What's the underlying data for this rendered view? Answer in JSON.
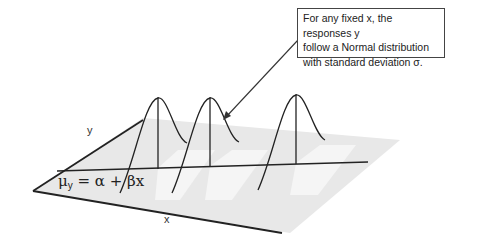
{
  "callout": {
    "lines": [
      "For any fixed x, the responses y",
      "follow a Normal distribution",
      "with standard deviation σ."
    ]
  },
  "axes": {
    "x_label": "x",
    "y_label": "y"
  },
  "equation": {
    "mu": "μ",
    "mu_sub": "y",
    "rhs": " = α + βx"
  },
  "colors": {
    "plane": "#e8e8e8",
    "line": "#333333"
  },
  "curves": [
    {
      "peak_x": 158,
      "peak_y": 97
    },
    {
      "peak_x": 210,
      "peak_y": 97
    },
    {
      "peak_x": 296,
      "peak_y": 94
    }
  ]
}
